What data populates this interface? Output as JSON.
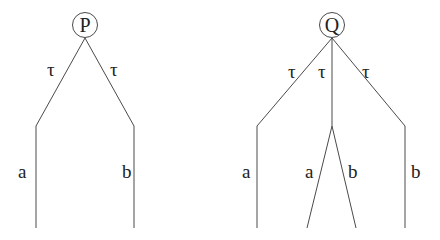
{
  "trees": [
    {
      "root": "P",
      "edges": [
        {
          "label": "τ",
          "child": {
            "edges": [
              {
                "label": "a"
              }
            ]
          }
        },
        {
          "label": "τ",
          "child": {
            "edges": [
              {
                "label": "b"
              }
            ]
          }
        }
      ]
    },
    {
      "root": "Q",
      "edges": [
        {
          "label": "τ",
          "child": {
            "edges": [
              {
                "label": "a"
              }
            ]
          }
        },
        {
          "label": "τ",
          "child": {
            "edges": [
              {
                "label": "a"
              },
              {
                "label": "b"
              }
            ]
          }
        },
        {
          "label": "τ",
          "child": {
            "edges": [
              {
                "label": "b"
              }
            ]
          }
        }
      ]
    }
  ],
  "labels": {
    "p_root": "P",
    "p_tau_left": "τ",
    "p_tau_right": "τ",
    "p_a": "a",
    "p_b": "b",
    "q_root": "Q",
    "q_tau_left": "τ",
    "q_tau_mid": "τ",
    "q_tau_right": "τ",
    "q_a_left": "a",
    "q_a_mid": "a",
    "q_b_mid": "b",
    "q_b_right": "b"
  }
}
